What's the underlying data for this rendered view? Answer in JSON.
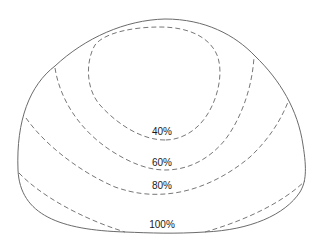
{
  "diagram": {
    "type": "isodose contour diagram",
    "outline": "dome-shaped region",
    "line_color": "#6b6b6b",
    "contour_color": "#777777",
    "contours": [
      {
        "label": "40%",
        "style": "dashed",
        "shape": "closed loop"
      },
      {
        "label": "60%",
        "style": "dashed",
        "shape": "open arc"
      },
      {
        "label": "80%",
        "style": "dashed",
        "shape": "open arc"
      },
      {
        "label": "100%",
        "style": "dashed",
        "shape": "open arc"
      }
    ]
  }
}
